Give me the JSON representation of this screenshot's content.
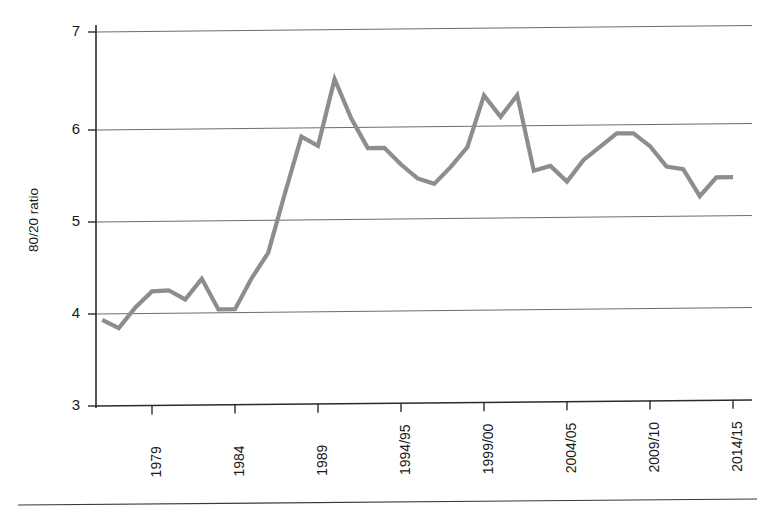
{
  "chart_data": {
    "type": "line",
    "title": "",
    "subtitle": "",
    "xlabel": "",
    "ylabel": "80/20 ratio",
    "ylim": [
      3,
      7
    ],
    "xlim": [
      1975.5,
      2015.5
    ],
    "grid": true,
    "legend": null,
    "series_color": "#8d8d8d",
    "y_ticks": [
      3,
      4,
      5,
      6,
      7
    ],
    "y_tick_labels": [
      "3",
      "4",
      "5",
      "6",
      "7"
    ],
    "x_ticks": [
      1979,
      1984,
      1989,
      1994,
      1999,
      2004,
      2009,
      2014
    ],
    "x_tick_labels": [
      "1979",
      "1984",
      "1989",
      "1994/95",
      "1999/00",
      "2004/05",
      "2009/10",
      "2014/15"
    ],
    "x_tick_rotation": 90,
    "x": [
      1976,
      1977,
      1978,
      1979,
      1980,
      1981,
      1982,
      1983,
      1984,
      1985,
      1986,
      1987,
      1988,
      1989,
      1990,
      1991,
      1992,
      1993,
      1994,
      1995,
      1996,
      1997,
      1998,
      1999,
      2000,
      2001,
      2002,
      2003,
      2004,
      2005,
      2006,
      2007,
      2008,
      2009,
      2010,
      2011,
      2012,
      2013,
      2014
    ],
    "categories": [
      "1976",
      "1977",
      "1978",
      "1979",
      "1980",
      "1981",
      "1982",
      "1983",
      "1984",
      "1985",
      "1986",
      "1987",
      "1988",
      "1989",
      "1990",
      "1991",
      "1992",
      "1993",
      "1994/95",
      "1995/96",
      "1996/97",
      "1997/98",
      "1998/99",
      "1999/00",
      "2000/01",
      "2001/02",
      "2002/03",
      "2003/04",
      "2004/05",
      "2005/06",
      "2006/07",
      "2007/08",
      "2008/09",
      "2009/10",
      "2010/11",
      "2011/12",
      "2012/13",
      "2013/14",
      "2014/15"
    ],
    "values": [
      3.92,
      3.83,
      4.05,
      4.22,
      4.23,
      4.13,
      4.35,
      4.02,
      4.02,
      4.35,
      4.62,
      5.25,
      5.86,
      5.76,
      6.47,
      6.05,
      5.73,
      5.73,
      5.55,
      5.4,
      5.34,
      5.52,
      5.73,
      6.28,
      6.05,
      6.28,
      5.47,
      5.52,
      5.35,
      5.58,
      5.72,
      5.86,
      5.86,
      5.72,
      5.5,
      5.47,
      5.18,
      5.38,
      5.38
    ],
    "series": [
      {
        "name": "80/20 ratio",
        "color": "#8d8d8d",
        "values": [
          3.92,
          3.83,
          4.05,
          4.22,
          4.23,
          4.13,
          4.35,
          4.02,
          4.02,
          4.35,
          4.62,
          5.25,
          5.86,
          5.76,
          6.47,
          6.05,
          5.73,
          5.73,
          5.55,
          5.4,
          5.34,
          5.52,
          5.73,
          6.28,
          6.05,
          6.28,
          5.47,
          5.52,
          5.35,
          5.58,
          5.72,
          5.86,
          5.86,
          5.72,
          5.5,
          5.47,
          5.18,
          5.38,
          5.38
        ]
      }
    ],
    "annotations": []
  },
  "figure": {
    "y_axis_title": "80/20 ratio",
    "footer_rule_visible": true
  }
}
